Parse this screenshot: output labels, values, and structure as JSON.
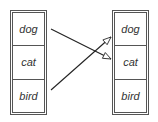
{
  "left_list": {
    "items": [
      {
        "label": "dog"
      },
      {
        "label": "cat"
      },
      {
        "label": "bird"
      }
    ]
  },
  "right_list": {
    "items": [
      {
        "label": "dog"
      },
      {
        "label": "cat"
      },
      {
        "label": "bird"
      }
    ]
  },
  "arrows": [
    {
      "from": "left.dog",
      "to": "right.cat",
      "x1": 51,
      "y1": 29,
      "x2": 111,
      "y2": 59
    },
    {
      "from": "left.bird",
      "to": "right.dog",
      "x1": 51,
      "y1": 90,
      "x2": 111,
      "y2": 37
    }
  ],
  "colors": {
    "line": "#222222",
    "border": "#555555",
    "text": "#333333"
  }
}
